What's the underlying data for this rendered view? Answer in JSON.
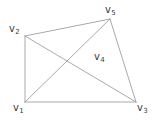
{
  "figure": {
    "type": "undirected-graph-diagram",
    "background_color": "#ffffff",
    "edge_color": "#9a9a9a",
    "label_color": "#3c3c3c",
    "width": 157,
    "height": 122,
    "vertices": [
      {
        "id": "v1",
        "letter": "v",
        "subscript": "1",
        "x": 25,
        "y": 102,
        "label_x": 13,
        "label_y": 103
      },
      {
        "id": "v2",
        "letter": "v",
        "subscript": "2",
        "x": 25,
        "y": 36,
        "label_x": 9,
        "label_y": 24
      },
      {
        "id": "v3",
        "letter": "v",
        "subscript": "3",
        "x": 136,
        "y": 102,
        "label_x": 137,
        "label_y": 103
      },
      {
        "id": "v4",
        "letter": "v",
        "subscript": "4",
        "x": 78,
        "y": 56,
        "label_x": 94,
        "label_y": 52
      },
      {
        "id": "v5",
        "letter": "v",
        "subscript": "5",
        "x": 110,
        "y": 19,
        "label_x": 105,
        "label_y": 5
      }
    ],
    "edges": [
      {
        "id": "edge-v1-v2",
        "from": "v1",
        "to": "v2",
        "x1": 25,
        "y1": 102,
        "x2": 25,
        "y2": 36
      },
      {
        "id": "edge-v2-v5",
        "from": "v2",
        "to": "v5",
        "x1": 25,
        "y1": 36,
        "x2": 110,
        "y2": 19
      },
      {
        "id": "edge-v5-v3",
        "from": "v5",
        "to": "v3",
        "x1": 110,
        "y1": 19,
        "x2": 136,
        "y2": 102
      },
      {
        "id": "edge-v1-v3",
        "from": "v1",
        "to": "v3",
        "x1": 25,
        "y1": 102,
        "x2": 136,
        "y2": 102
      },
      {
        "id": "edge-v2-v3",
        "from": "v2",
        "to": "v3",
        "x1": 25,
        "y1": 36,
        "x2": 136,
        "y2": 102
      },
      {
        "id": "edge-v1-v5",
        "from": "v1",
        "to": "v5",
        "x1": 25,
        "y1": 102,
        "x2": 110,
        "y2": 19
      }
    ]
  }
}
